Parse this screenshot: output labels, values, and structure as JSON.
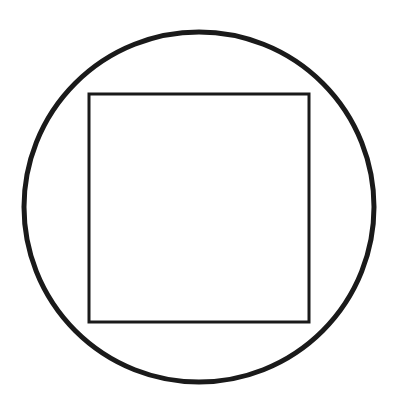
{
  "diagram": {
    "background": "#ffffff",
    "stroke_color": "#1a1a1a",
    "circle": {
      "cx": 199,
      "cy": 207,
      "r": 175,
      "stroke_width": 5
    },
    "square": {
      "x": 89,
      "y": 94,
      "width": 220,
      "height": 228,
      "stroke_width": 3
    }
  }
}
